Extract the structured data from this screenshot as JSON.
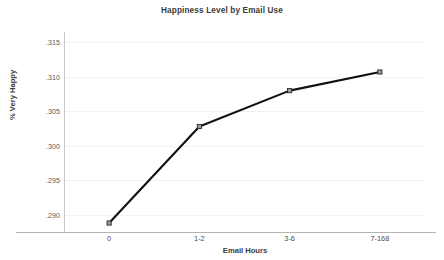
{
  "chart_data": {
    "type": "line",
    "title": "Happiness Level by Email Use",
    "xlabel": "Email Hours",
    "ylabel": "% Very Happy",
    "categories": [
      "0",
      "1-2",
      "3-6",
      "7-168"
    ],
    "values": [
      0.2888,
      0.3028,
      0.308,
      0.3107
    ],
    "ytick_labels": [
      ".315",
      ".310",
      ".305",
      ".300",
      ".295",
      ".290"
    ],
    "ytick_values": [
      0.315,
      0.31,
      0.305,
      0.3,
      0.295,
      0.29
    ],
    "ylim": [
      0.2875,
      0.3165
    ],
    "grid": true,
    "legend": "none",
    "series": [
      {
        "name": "% Very Happy",
        "values": [
          0.2888,
          0.3028,
          0.308,
          0.3107
        ]
      }
    ],
    "colors": {
      "line": "#101010",
      "marker_fill": "#9a9a9a",
      "marker_stroke": "#2a2a2a",
      "gridline": "#f2f2f4",
      "axis": "#c8c8c8",
      "text": "#3b3b3b",
      "background": "#ffffff"
    }
  }
}
